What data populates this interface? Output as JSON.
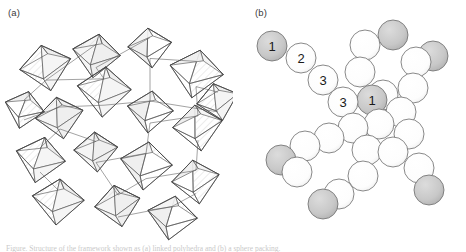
{
  "figure": {
    "width": 466,
    "height": 252,
    "background": "#ffffff",
    "caption_fragment": "Figure. Structure of the framework shown as (a) linked polyhedra and (b) a sphere packing.",
    "panels": [
      {
        "id": "a",
        "label": "(a)",
        "representation": "polyhedral-framework"
      },
      {
        "id": "b",
        "label": "(b)",
        "representation": "sphere-packing"
      }
    ]
  },
  "colors": {
    "stroke": "#4a4a4a",
    "sphere_outline": "#6b6b6b",
    "sphere_white_fill": "#ffffff",
    "sphere_gray_fill": "#c8c8c8",
    "polyhedron_face_light": "#f4f4f4",
    "polyhedron_face_mid": "#eaeaea",
    "hatch": "#d8d8d8",
    "label_text": "#3a3a3a",
    "numeral_text": "#1a1a1a"
  },
  "panel_a": {
    "label": "(a)",
    "description": "Network of corner- and edge-sharing octahedra drawn in thin outline with pale hatched faces.",
    "polyhedra": [
      {
        "cx": 46,
        "cy": 68,
        "rx": 26,
        "ry": 22,
        "tilt": -12
      },
      {
        "cx": 96,
        "cy": 56,
        "rx": 24,
        "ry": 21,
        "tilt": 8
      },
      {
        "cx": 150,
        "cy": 48,
        "rx": 22,
        "ry": 19,
        "tilt": -6
      },
      {
        "cx": 196,
        "cy": 74,
        "rx": 27,
        "ry": 23,
        "tilt": 10
      },
      {
        "cx": 104,
        "cy": 92,
        "rx": 27,
        "ry": 24,
        "tilt": 4
      },
      {
        "cx": 60,
        "cy": 118,
        "rx": 24,
        "ry": 20,
        "tilt": -10
      },
      {
        "cx": 150,
        "cy": 112,
        "rx": 23,
        "ry": 20,
        "tilt": 6
      },
      {
        "cx": 198,
        "cy": 128,
        "rx": 25,
        "ry": 22,
        "tilt": -8
      },
      {
        "cx": 40,
        "cy": 160,
        "rx": 25,
        "ry": 22,
        "tilt": 12
      },
      {
        "cx": 96,
        "cy": 152,
        "rx": 22,
        "ry": 19,
        "tilt": -4
      },
      {
        "cx": 146,
        "cy": 166,
        "rx": 26,
        "ry": 23,
        "tilt": 7
      },
      {
        "cx": 196,
        "cy": 182,
        "rx": 24,
        "ry": 21,
        "tilt": -9
      },
      {
        "cx": 58,
        "cy": 202,
        "rx": 26,
        "ry": 22,
        "tilt": 5
      },
      {
        "cx": 118,
        "cy": 206,
        "rx": 23,
        "ry": 20,
        "tilt": -11
      },
      {
        "cx": 172,
        "cy": 218,
        "rx": 25,
        "ry": 21,
        "tilt": 9
      },
      {
        "cx": 24,
        "cy": 110,
        "rx": 20,
        "ry": 18,
        "tilt": 14
      },
      {
        "cx": 218,
        "cy": 102,
        "rx": 21,
        "ry": 18,
        "tilt": -14
      }
    ]
  },
  "panel_b": {
    "label": "(b)",
    "description": "Space-filling sphere packing; shaded gray spheres mark one symmetry-distinct site, numerals label sites 1, 2 and 3.",
    "sphere_radius": 15,
    "legend_sites": [
      "1",
      "2",
      "3"
    ],
    "spheres": [
      {
        "id": "s01",
        "cx": 39,
        "cy": 46,
        "fill": "gray",
        "label": "1"
      },
      {
        "id": "s02",
        "cx": 68,
        "cy": 58,
        "fill": "white",
        "label": "2"
      },
      {
        "id": "s03",
        "cx": 90,
        "cy": 80,
        "fill": "white",
        "label": "3"
      },
      {
        "id": "s04",
        "cx": 110,
        "cy": 102,
        "fill": "white",
        "label": "3"
      },
      {
        "id": "s05",
        "cx": 139,
        "cy": 100,
        "fill": "gray",
        "label": "1"
      },
      {
        "id": "s06",
        "cx": 132,
        "cy": 45,
        "fill": "white",
        "label": ""
      },
      {
        "id": "s07",
        "cx": 160,
        "cy": 35,
        "fill": "gray",
        "label": ""
      },
      {
        "id": "s08",
        "cx": 127,
        "cy": 72,
        "fill": "white",
        "label": ""
      },
      {
        "id": "s09",
        "cx": 150,
        "cy": 95,
        "fill": "white",
        "label": ""
      },
      {
        "id": "s10",
        "cx": 183,
        "cy": 62,
        "fill": "white",
        "label": ""
      },
      {
        "id": "s11",
        "cx": 200,
        "cy": 56,
        "fill": "gray",
        "label": ""
      },
      {
        "id": "s12",
        "cx": 180,
        "cy": 88,
        "fill": "white",
        "label": ""
      },
      {
        "id": "s13",
        "cx": 168,
        "cy": 112,
        "fill": "white",
        "label": ""
      },
      {
        "id": "s14",
        "cx": 146,
        "cy": 124,
        "fill": "white",
        "label": ""
      },
      {
        "id": "s15",
        "cx": 120,
        "cy": 128,
        "fill": "white",
        "label": ""
      },
      {
        "id": "s16",
        "cx": 96,
        "cy": 138,
        "fill": "white",
        "label": ""
      },
      {
        "id": "s17",
        "cx": 72,
        "cy": 146,
        "fill": "white",
        "label": ""
      },
      {
        "id": "s18",
        "cx": 48,
        "cy": 160,
        "fill": "gray",
        "label": ""
      },
      {
        "id": "s19",
        "cx": 64,
        "cy": 172,
        "fill": "white",
        "label": ""
      },
      {
        "id": "s20",
        "cx": 134,
        "cy": 150,
        "fill": "white",
        "label": ""
      },
      {
        "id": "s21",
        "cx": 130,
        "cy": 176,
        "fill": "white",
        "label": ""
      },
      {
        "id": "s22",
        "cx": 106,
        "cy": 194,
        "fill": "white",
        "label": ""
      },
      {
        "id": "s23",
        "cx": 90,
        "cy": 204,
        "fill": "gray",
        "label": ""
      },
      {
        "id": "s24",
        "cx": 160,
        "cy": 152,
        "fill": "white",
        "label": ""
      },
      {
        "id": "s25",
        "cx": 186,
        "cy": 168,
        "fill": "white",
        "label": ""
      },
      {
        "id": "s26",
        "cx": 196,
        "cy": 190,
        "fill": "gray",
        "label": ""
      },
      {
        "id": "s27",
        "cx": 176,
        "cy": 134,
        "fill": "white",
        "label": ""
      }
    ]
  }
}
